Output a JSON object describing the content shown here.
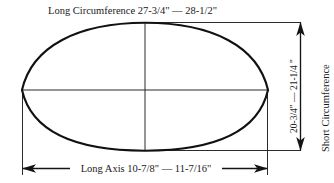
{
  "diagram": {
    "type": "technical-measurement-diagram",
    "background_color": "#ffffff",
    "line_color": "#111111",
    "text_color": "#1a1a1a",
    "labels": {
      "long_circumference": "Long Circumference 27-3/4\" — 28-1/2\"",
      "long_axis": "Long Axis 10-7/8\" — 11-7/16\"",
      "short_circumference_value": "20-3/4\" — 21-1/4 \"",
      "short_circumference_name": "Short Circumference"
    },
    "measurements": [
      {
        "name": "Long Circumference",
        "min": "27-3/4\"",
        "max": "28-1/2\"",
        "position": "top"
      },
      {
        "name": "Long Axis",
        "min": "10-7/8\"",
        "max": "11-7/16\"",
        "position": "bottom"
      },
      {
        "name": "Short Circumference",
        "min": "20-3/4\"",
        "max": "21-1/4 \"",
        "position": "right"
      }
    ],
    "shape": {
      "name": "football-vesica-outline",
      "left_tip": [
        22,
        90
      ],
      "right_tip": [
        268,
        90
      ],
      "top_apex": [
        145,
        23
      ],
      "bottom_apex": [
        145,
        150
      ]
    }
  }
}
